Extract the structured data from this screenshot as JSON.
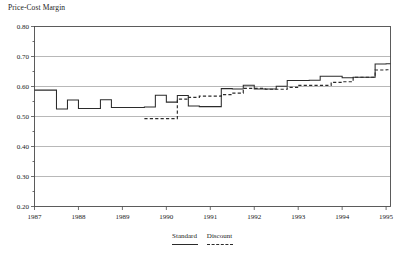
{
  "chart_data": {
    "type": "line",
    "title": "Price-Cost Margin",
    "xlabel": "",
    "ylabel": "Price-Cost Margin",
    "xlim": [
      1987.0,
      1995.1
    ],
    "ylim": [
      0.2,
      0.8
    ],
    "grid": true,
    "legend_position": "bottom-center",
    "step_style": "post",
    "ytick_labels": [
      "0.80",
      "0.70",
      "0.60",
      "0.50",
      "0.40",
      "0.30",
      "0.20"
    ],
    "ytick_values": [
      0.8,
      0.7,
      0.6,
      0.5,
      0.4,
      0.3,
      0.2
    ],
    "xtick_labels": [
      "1987",
      "1988",
      "1989",
      "1990",
      "1991",
      "1992",
      "1993",
      "1994",
      "1995"
    ],
    "xtick_values": [
      1987,
      1988,
      1989,
      1990,
      1991,
      1992,
      1993,
      1994,
      1995
    ],
    "series": [
      {
        "name": "Standard",
        "style": "solid",
        "color": "#2b2b2b",
        "x": [
          1987.0,
          1987.25,
          1987.5,
          1987.75,
          1988.0,
          1988.25,
          1988.5,
          1988.75,
          1989.0,
          1989.25,
          1989.5,
          1989.75,
          1990.0,
          1990.25,
          1990.5,
          1990.75,
          1991.0,
          1991.25,
          1991.5,
          1991.75,
          1992.0,
          1992.25,
          1992.5,
          1992.75,
          1993.0,
          1993.25,
          1993.5,
          1993.75,
          1994.0,
          1994.25,
          1994.5,
          1994.75,
          1995.0,
          1995.1
        ],
        "values": [
          0.588,
          0.588,
          0.525,
          0.555,
          0.527,
          0.527,
          0.556,
          0.53,
          0.53,
          0.53,
          0.532,
          0.571,
          0.548,
          0.57,
          0.535,
          0.533,
          0.533,
          0.593,
          0.592,
          0.604,
          0.592,
          0.592,
          0.601,
          0.62,
          0.62,
          0.621,
          0.634,
          0.634,
          0.629,
          0.631,
          0.631,
          0.675,
          0.676,
          0.676
        ]
      },
      {
        "name": "Discount",
        "style": "dashed",
        "color": "#2b2b2b",
        "x": [
          1989.5,
          1989.75,
          1990.0,
          1990.25,
          1990.5,
          1990.75,
          1991.0,
          1991.25,
          1991.5,
          1991.75,
          1992.0,
          1992.25,
          1992.5,
          1992.75,
          1993.0,
          1993.25,
          1993.5,
          1993.75,
          1994.0,
          1994.25,
          1994.5,
          1994.75,
          1995.0,
          1995.1
        ],
        "values": [
          0.493,
          0.493,
          0.493,
          0.558,
          0.564,
          0.568,
          0.568,
          0.573,
          0.578,
          0.594,
          0.594,
          0.591,
          0.591,
          0.597,
          0.604,
          0.604,
          0.604,
          0.614,
          0.616,
          0.631,
          0.631,
          0.655,
          0.656,
          0.656
        ]
      }
    ],
    "annotations": []
  },
  "legend": {
    "entries": [
      {
        "label": "Standard",
        "style": "solid"
      },
      {
        "label": "Discount",
        "style": "dashed"
      }
    ]
  }
}
